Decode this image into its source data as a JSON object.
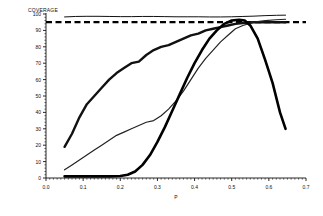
{
  "chart_data": {
    "type": "line",
    "title": "",
    "ylabel": "COVERAGE",
    "xlabel": "P",
    "xlim": [
      0.0,
      0.7
    ],
    "ylim": [
      0,
      100
    ],
    "xticks": [
      0.0,
      0.1,
      0.2,
      0.3,
      0.4,
      0.5,
      0.6,
      0.7
    ],
    "xticklabels": [
      "0.0",
      "0.1",
      "0.2",
      "0.3",
      "0.4",
      "0.5",
      "0.6",
      "0.7"
    ],
    "yticks": [
      0,
      10,
      20,
      30,
      40,
      50,
      60,
      70,
      80,
      90,
      100
    ],
    "yticklabels": [
      "0",
      "10",
      "20",
      "30",
      "40",
      "50",
      "60",
      "70",
      "80",
      "90",
      "100"
    ],
    "grid": false,
    "legend": "none",
    "minor_ticks": true,
    "reference_lines": [
      {
        "name": "nominal-level",
        "axis": "y",
        "value": 95,
        "style": "dashed",
        "color": "#000000",
        "width": 2.2
      }
    ],
    "series": [
      {
        "name": "curve-flat-top",
        "style": "solid",
        "color": "#111111",
        "width": 1.0,
        "x": [
          0.05,
          0.08,
          0.11,
          0.14,
          0.17,
          0.2,
          0.23,
          0.26,
          0.29,
          0.32,
          0.35,
          0.38,
          0.41,
          0.44,
          0.47,
          0.5,
          0.53,
          0.56,
          0.59,
          0.62,
          0.645
        ],
        "y": [
          98.2,
          98.5,
          98.6,
          98.6,
          98.5,
          98.4,
          98.4,
          98.5,
          98.5,
          98.4,
          98.3,
          98.3,
          98.3,
          98.2,
          98.2,
          98.3,
          98.5,
          98.7,
          99.0,
          99.2,
          99.3
        ]
      },
      {
        "name": "curve-thick-early-rise",
        "style": "solid",
        "color": "#111111",
        "width": 2.4,
        "x": [
          0.05,
          0.07,
          0.09,
          0.11,
          0.13,
          0.15,
          0.17,
          0.19,
          0.21,
          0.23,
          0.25,
          0.27,
          0.29,
          0.31,
          0.33,
          0.35,
          0.37,
          0.39,
          0.41,
          0.43,
          0.45,
          0.47,
          0.49,
          0.51,
          0.53,
          0.56,
          0.59,
          0.62,
          0.645
        ],
        "y": [
          19,
          27,
          37,
          45,
          50,
          55,
          60,
          64,
          67,
          70,
          71,
          75,
          78,
          80,
          81,
          83,
          85,
          87,
          88,
          90,
          91,
          92,
          93,
          94,
          94.5,
          95,
          95,
          95,
          95
        ]
      },
      {
        "name": "curve-thin-mid-rise",
        "style": "solid",
        "color": "#222222",
        "width": 1.2,
        "x": [
          0.05,
          0.07,
          0.09,
          0.11,
          0.13,
          0.15,
          0.17,
          0.19,
          0.21,
          0.23,
          0.25,
          0.27,
          0.29,
          0.31,
          0.33,
          0.35,
          0.37,
          0.39,
          0.41,
          0.43,
          0.45,
          0.47,
          0.49,
          0.51,
          0.53,
          0.56,
          0.59,
          0.62,
          0.645
        ],
        "y": [
          5,
          8,
          11,
          14,
          17,
          20,
          23,
          26,
          28,
          30,
          32,
          34,
          35,
          38,
          42,
          47,
          53,
          60,
          67,
          73,
          78,
          83,
          87,
          91,
          93,
          95,
          96,
          96.5,
          96.8
        ]
      },
      {
        "name": "curve-thick-late-rise-fall",
        "style": "solid",
        "color": "#000000",
        "width": 2.6,
        "x": [
          0.05,
          0.09,
          0.13,
          0.17,
          0.2,
          0.22,
          0.24,
          0.26,
          0.28,
          0.3,
          0.32,
          0.34,
          0.36,
          0.38,
          0.4,
          0.42,
          0.44,
          0.46,
          0.48,
          0.5,
          0.52,
          0.535,
          0.55,
          0.57,
          0.59,
          0.61,
          0.63,
          0.645
        ],
        "y": [
          1,
          1,
          1,
          1,
          1.2,
          2,
          4,
          8,
          14,
          22,
          31,
          41,
          51,
          61,
          70,
          78,
          85,
          90,
          94,
          96,
          96.5,
          96,
          93,
          85,
          72,
          58,
          40,
          30
        ]
      }
    ]
  }
}
